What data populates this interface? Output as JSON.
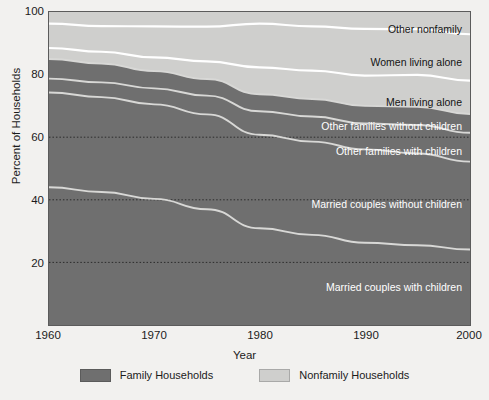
{
  "chart_data": {
    "type": "area",
    "title": "",
    "xlabel": "Year",
    "ylabel": "Percent of Households",
    "xlim": [
      1960,
      2000
    ],
    "ylim": [
      0,
      100
    ],
    "grid": "dotted horizontal reference lines at 20, 40, 60",
    "legend_position": "bottom-center",
    "stacking": "cumulative from bottom to 100 percent",
    "x": [
      1960,
      1965,
      1970,
      1975,
      1980,
      1985,
      1990,
      1995,
      2000
    ],
    "xticks": [
      1960,
      1970,
      1980,
      1990,
      2000
    ],
    "yticks": [
      0,
      20,
      40,
      60,
      80,
      100
    ],
    "gridlines": [
      20,
      40,
      60
    ],
    "series": [
      {
        "name": "Married couples with children",
        "group": "Family Households",
        "color": "#6f6f6f",
        "values": [
          44.0,
          42.5,
          40.3,
          37.0,
          30.9,
          28.8,
          26.3,
          25.5,
          24.1
        ]
      },
      {
        "name": "Married couples without children",
        "group": "Family Households",
        "color": "#6f6f6f",
        "values": [
          30.3,
          30.3,
          30.2,
          30.3,
          29.9,
          29.8,
          29.8,
          29.3,
          28.1
        ]
      },
      {
        "name": "Other families with children",
        "group": "Family Households",
        "color": "#6f6f6f",
        "values": [
          4.4,
          4.7,
          5.1,
          6.0,
          7.5,
          8.0,
          8.3,
          9.1,
          9.2
        ]
      },
      {
        "name": "Other families without children",
        "group": "Family Households",
        "color": "#6f6f6f",
        "values": [
          6.3,
          6.0,
          5.5,
          5.3,
          5.4,
          5.6,
          5.6,
          5.8,
          6.0
        ]
      },
      {
        "name": "Men living alone",
        "group": "Nonfamily Households",
        "color": "#cfcfcd",
        "values": [
          3.5,
          3.8,
          4.4,
          5.6,
          8.6,
          9.1,
          9.7,
          10.2,
          10.7
        ]
      },
      {
        "name": "Women living alone",
        "group": "Nonfamily Households",
        "color": "#cfcfcd",
        "values": [
          7.8,
          8.2,
          9.9,
          11.1,
          14.0,
          14.1,
          14.9,
          14.6,
          14.8
        ]
      },
      {
        "name": "Other nonfamily",
        "group": "Nonfamily Households",
        "color": "#cfcfcd",
        "values": [
          3.7,
          4.5,
          4.6,
          4.7,
          3.7,
          4.6,
          5.4,
          5.5,
          7.1
        ]
      }
    ],
    "cumulative_boundaries": {
      "note": "top edge of each band, percent of households, at x ticks 1960..2000",
      "married_with_children": [
        44.0,
        42.5,
        40.3,
        37.0,
        30.9,
        28.8,
        26.3,
        25.5,
        24.1
      ],
      "married_without_children": [
        74.3,
        72.8,
        70.5,
        67.3,
        60.8,
        58.6,
        56.1,
        54.8,
        52.2
      ],
      "other_families_with_children": [
        78.7,
        77.5,
        75.6,
        73.3,
        68.3,
        66.6,
        64.4,
        63.9,
        61.4
      ],
      "other_families_without_children": [
        85.0,
        83.5,
        81.1,
        78.6,
        73.7,
        72.2,
        70.0,
        69.7,
        67.4
      ],
      "men_living_alone": [
        88.5,
        87.3,
        85.5,
        84.2,
        82.3,
        81.3,
        79.7,
        79.9,
        78.1
      ],
      "women_living_alone": [
        96.3,
        95.5,
        95.4,
        95.3,
        96.3,
        95.4,
        94.6,
        94.5,
        92.9
      ],
      "other_nonfamily": [
        100,
        100,
        100,
        100,
        100,
        100,
        100,
        100,
        100
      ]
    }
  },
  "axes": {
    "y_title": "Percent of Households",
    "x_title": "Year",
    "y_ticks": [
      "100",
      "80",
      "60",
      "40",
      "20"
    ],
    "x_ticks": [
      "1960",
      "1970",
      "1980",
      "1990",
      "2000"
    ]
  },
  "series_labels": [
    {
      "text": "Other nonfamily",
      "tone": "dark"
    },
    {
      "text": "Women living alone",
      "tone": "dark"
    },
    {
      "text": "Men living alone",
      "tone": "dark"
    },
    {
      "text": "Other families without children",
      "tone": "light"
    },
    {
      "text": "Other families with children",
      "tone": "light"
    },
    {
      "text": "Married couples without children",
      "tone": "light"
    },
    {
      "text": "Married couples with children",
      "tone": "light"
    }
  ],
  "legend": {
    "items": [
      {
        "label": "Family Households",
        "color": "#6f6f6f"
      },
      {
        "label": "Nonfamily Households",
        "color": "#cfcfcd"
      }
    ]
  },
  "colors": {
    "family": "#6f6f6f",
    "nonfamily": "#cfcfcd",
    "band_divider": "#d8d8d6",
    "nonfamily_divider": "#ffffff",
    "page_background": "#f2f1ef",
    "frame": "#5b5b5b",
    "gridline": "#2a2a2a"
  }
}
